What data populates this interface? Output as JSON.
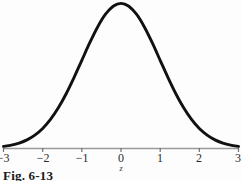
{
  "figure": {
    "caption": "Fig. 6-13",
    "axis_variable_label": "z",
    "background_color": "#fdfdfd",
    "curve_color": "#111111",
    "axis_color": "#9a9a9a",
    "tick_color": "#6e6e6e",
    "label_color": "#2b2b2b"
  },
  "chart_data": {
    "type": "line",
    "title": "",
    "subtitle": "",
    "xlabel": "z",
    "ylabel": "",
    "grid": false,
    "legend": null,
    "xlim": [
      -3,
      3
    ],
    "ylim": [
      0,
      0.4
    ],
    "xticks": [
      -3,
      -2,
      -1,
      0,
      1,
      2,
      3
    ],
    "xticklabels": [
      "−3",
      "−2",
      "−1",
      "0",
      "1",
      "2",
      "3"
    ],
    "yticks": [],
    "yticklabels": [],
    "series": [
      {
        "name": "standard normal density",
        "x": [
          -3,
          -2.8,
          -2.6,
          -2.4,
          -2.2,
          -2,
          -1.8,
          -1.6,
          -1.4,
          -1.2,
          -1,
          -0.8,
          -0.6,
          -0.4,
          -0.2,
          0,
          0.2,
          0.4,
          0.6,
          0.8,
          1,
          1.2,
          1.4,
          1.6,
          1.8,
          2,
          2.2,
          2.4,
          2.6,
          2.8,
          3
        ],
        "y": [
          0.0044,
          0.0079,
          0.0136,
          0.0224,
          0.0355,
          0.054,
          0.079,
          0.1109,
          0.1497,
          0.1942,
          0.242,
          0.2897,
          0.3332,
          0.3683,
          0.391,
          0.3989,
          0.391,
          0.3683,
          0.3332,
          0.2897,
          0.242,
          0.1942,
          0.1497,
          0.1109,
          0.079,
          0.054,
          0.0355,
          0.0224,
          0.0136,
          0.0079,
          0.0044
        ]
      }
    ]
  }
}
